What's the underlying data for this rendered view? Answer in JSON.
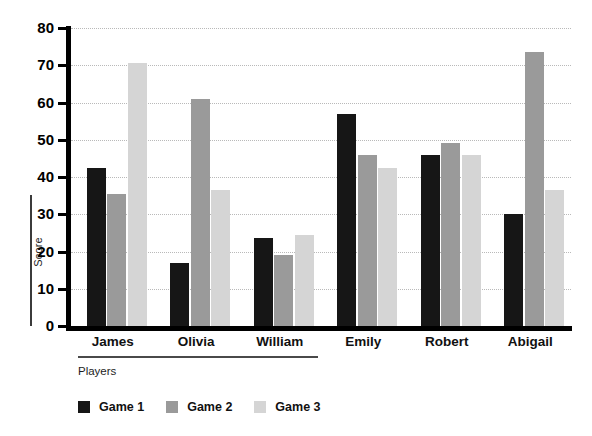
{
  "chart_data": {
    "type": "bar",
    "title": "",
    "xlabel": "Players",
    "ylabel": "Score",
    "categories": [
      "James",
      "Olivia",
      "William",
      "Emily",
      "Robert",
      "Abigail"
    ],
    "series": [
      {
        "name": "Game 1",
        "color": "#161616",
        "values": [
          42.5,
          17.0,
          23.5,
          57.0,
          46.0,
          30.0
        ]
      },
      {
        "name": "Game 2",
        "color": "#9a9a9a",
        "values": [
          35.5,
          61.0,
          19.0,
          46.0,
          49.0,
          73.5
        ]
      },
      {
        "name": "Game 3",
        "color": "#d5d5d5",
        "values": [
          70.5,
          36.5,
          24.5,
          42.5,
          46.0,
          36.5
        ]
      }
    ],
    "ylim": [
      0,
      80
    ],
    "yticks": [
      0,
      10,
      20,
      30,
      40,
      50,
      60,
      70,
      80
    ],
    "ytick_labels": [
      "0",
      "10",
      "20",
      "30",
      "40",
      "50",
      "60",
      "70",
      "80"
    ],
    "grid": true,
    "grid_axis": "y",
    "grid_style": "dotted",
    "legend_position": "bottom-left",
    "legend_entries": [
      "Game 1",
      "Game 2",
      "Game 3"
    ],
    "background": "#ffffff",
    "axis_color": "#000000"
  }
}
